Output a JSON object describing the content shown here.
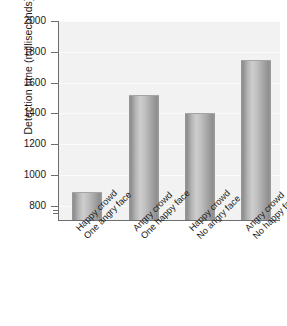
{
  "chart_data": {
    "type": "bar",
    "title": "",
    "subtitle": "",
    "xlabel": "",
    "ylabel": "Detection time (milliseconds)",
    "ylim": [
      700,
      2000
    ],
    "ytick_labels": [
      "2000",
      "1800",
      "1600",
      "1400",
      "1200",
      "1000",
      "800"
    ],
    "yticks": [
      2000,
      1800,
      1600,
      1400,
      1200,
      1000,
      800
    ],
    "y_axis_break": true,
    "grid": false,
    "legend": null,
    "categories": [
      "Happy crowd One angry face",
      "Angry crowd One happy face",
      "Happy crowd No angry face",
      "Angry crowd No happy face"
    ],
    "category_lines": [
      {
        "line1": "Happy crowd",
        "line2": "One angry face"
      },
      {
        "line1": "Angry crowd",
        "line2": "One happy face"
      },
      {
        "line1": "Happy crowd",
        "line2": "No angry face"
      },
      {
        "line1": "Angry crowd",
        "line2": "No happy face"
      }
    ],
    "values": [
      880,
      1510,
      1395,
      1740
    ],
    "bar_color": "#b0b0b0",
    "bar_edge_color": "#8e8e8e",
    "plot_background": "#f2f2f2",
    "axis_color": "#6d6d6d",
    "text_color": "#1a1a1a"
  }
}
